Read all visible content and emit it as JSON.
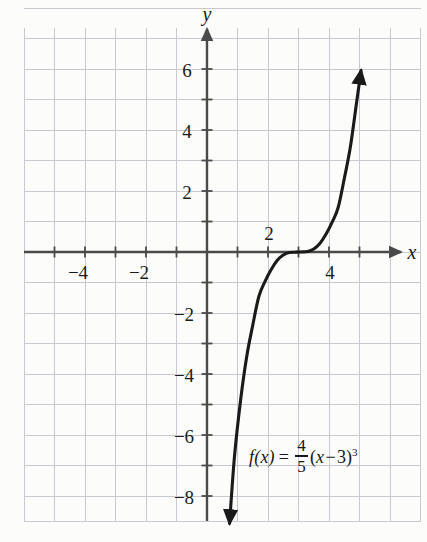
{
  "figure": {
    "kind": "cartesian-graph",
    "background_color": "#fcfcfa",
    "grid_color": "#c9c9cf",
    "axis_color": "#4a4a4a",
    "curve_color": "#1a1a1a",
    "text_color": "#1b1b1b"
  },
  "axes": {
    "x_axis_label": "x",
    "y_axis_label": "y",
    "x_ticks": [
      {
        "label": "−4",
        "value": -4,
        "position": "below"
      },
      {
        "label": "−2",
        "value": -2,
        "position": "below"
      },
      {
        "label": "2",
        "value": 2,
        "position": "above"
      },
      {
        "label": "4",
        "value": 4,
        "position": "below"
      }
    ],
    "y_ticks": [
      {
        "label": "6",
        "value": 6
      },
      {
        "label": "4",
        "value": 4
      },
      {
        "label": "2",
        "value": 2
      },
      {
        "label": "−2",
        "value": -2
      },
      {
        "label": "−4",
        "value": -4
      },
      {
        "label": "−6",
        "value": -6
      },
      {
        "label": "−8",
        "value": -8
      }
    ],
    "xlim": [
      -6,
      7
    ],
    "ylim": [
      -9.5,
      8
    ],
    "grid": true,
    "grid_step": 1,
    "tick_step": 1
  },
  "equation": {
    "function_name": "f(x)",
    "equals": "=",
    "coefficient_numerator": "4",
    "coefficient_denominator": "5",
    "open_paren": "(",
    "variable": "x",
    "minus": "−",
    "shift": "3",
    "close_paren": ")",
    "exponent": "3",
    "plain_text": "f(x) = 4/5 (x − 3)^3"
  },
  "chart_data": {
    "type": "line",
    "title": "",
    "xlabel": "x",
    "ylabel": "y",
    "xlim": [
      -6,
      7
    ],
    "ylim": [
      -9.5,
      8
    ],
    "grid": true,
    "legend": "none",
    "annotations": [
      {
        "text": "f(x) = 4/5 (x − 3)^3",
        "x": 4.3,
        "y": -6.7
      }
    ],
    "series": [
      {
        "name": "f(x) = 4/5 (x - 3)^3",
        "expression": "0.8*(x-3)**3",
        "arrow_start": true,
        "arrow_end": true,
        "x": [
          0.74,
          0.9,
          1.1,
          1.3,
          1.5,
          1.7,
          1.9,
          2.1,
          2.3,
          2.5,
          2.7,
          2.9,
          3.0,
          3.1,
          3.3,
          3.5,
          3.7,
          3.9,
          4.1,
          4.3,
          4.5,
          4.7,
          4.9,
          5.05
        ],
        "y": [
          -8.9,
          -6.72,
          -4.87,
          -3.44,
          -2.4,
          -1.46,
          -0.97,
          -0.58,
          -0.28,
          -0.1,
          -0.02,
          -0.0064,
          0.0,
          0.0008,
          0.02,
          0.1,
          0.28,
          0.58,
          0.97,
          1.46,
          2.4,
          3.44,
          4.87,
          5.95
        ],
        "inflection_point": {
          "x": 3,
          "y": 0
        },
        "x_intercept": {
          "x": 3,
          "y": 0
        }
      }
    ],
    "key_points": [
      {
        "label": "inflection / root",
        "x": 3,
        "y": 0
      }
    ]
  }
}
